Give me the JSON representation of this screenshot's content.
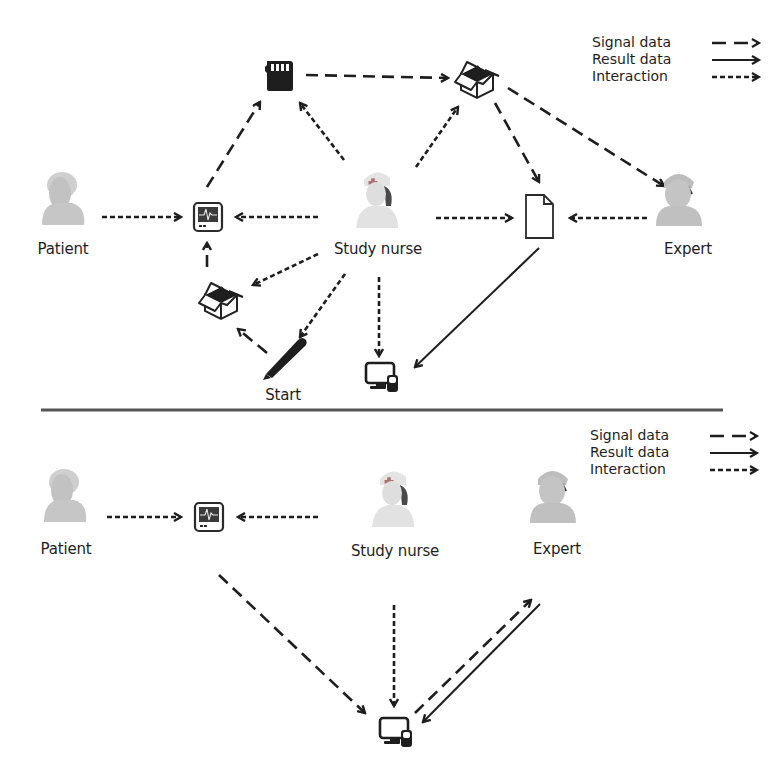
{
  "top_panel": {
    "legend": {
      "signal": "Signal data",
      "result": "Result data",
      "interaction": "Interaction"
    },
    "nodes": {
      "patient": "Patient",
      "nurse": "Study nurse",
      "expert": "Expert",
      "start": "Start"
    },
    "icons": [
      "patient-avatar",
      "ecg-monitor",
      "memory-card",
      "open-box",
      "open-box",
      "document",
      "pen",
      "computer-phone",
      "study-nurse-avatar",
      "expert-avatar"
    ]
  },
  "bottom_panel": {
    "legend": {
      "signal": "Signal data",
      "result": "Result data",
      "interaction": "Interaction"
    },
    "nodes": {
      "patient": "Patient",
      "nurse": "Study nurse",
      "expert": "Expert"
    },
    "icons": [
      "patient-avatar",
      "ecg-monitor",
      "study-nurse-avatar",
      "expert-avatar",
      "computer-phone"
    ]
  },
  "colors": {
    "line": "#1e1e1e",
    "divider": "#555555",
    "avatar": "#c4c4c4",
    "monitor_screen": "#333333"
  }
}
